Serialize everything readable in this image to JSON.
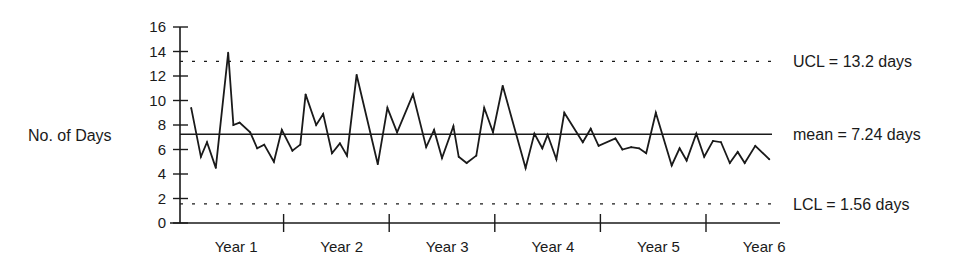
{
  "chart_data": {
    "type": "line",
    "title": "",
    "xlabel": "",
    "ylabel": "No. of Days",
    "ylim": [
      0,
      16
    ],
    "yticks": [
      0,
      2,
      4,
      6,
      8,
      10,
      12,
      14,
      16
    ],
    "xlim_months": [
      0,
      68.4
    ],
    "year_boundaries_months": [
      12,
      24,
      36,
      48,
      60
    ],
    "categories": [
      "Year 1",
      "Year 2",
      "Year 3",
      "Year 4",
      "Year 5",
      "Year 6"
    ],
    "grid": false,
    "legend": "none",
    "reference_lines": [
      {
        "name": "UCL",
        "value": 13.2,
        "style": "dotted",
        "label": "UCL = 13.2 days"
      },
      {
        "name": "mean",
        "value": 7.24,
        "style": "solid",
        "label": "mean = 7.24 days"
      },
      {
        "name": "LCL",
        "value": 1.56,
        "style": "dotted",
        "label": "LCL = 1.56 days"
      }
    ],
    "series": [
      {
        "name": "No. of Days",
        "x": [
          1.5,
          2.6,
          3.3,
          4.3,
          5.7,
          6.3,
          7.0,
          8.2,
          9.0,
          9.8,
          10.9,
          11.8,
          13.0,
          13.9,
          14.5,
          15.7,
          16.5,
          17.5,
          18.4,
          19.2,
          20.3,
          22.7,
          23.8,
          24.9,
          26.7,
          28.2,
          29.1,
          30.0,
          31.3,
          31.9,
          32.8,
          33.9,
          34.8,
          35.8,
          36.9,
          39.5,
          40.5,
          41.4,
          42.0,
          43.0,
          43.9,
          46.0,
          46.9,
          47.8,
          49.7,
          50.5,
          51.5,
          52.4,
          53.2,
          54.3,
          56.1,
          57.0,
          57.8,
          58.9,
          59.8,
          60.8,
          61.7,
          62.7,
          63.6,
          64.4,
          65.6,
          67.2
        ],
        "values": [
          9.4,
          5.4,
          6.6,
          4.5,
          13.9,
          8.0,
          8.2,
          7.4,
          6.1,
          6.4,
          5.0,
          7.6,
          5.9,
          6.4,
          10.5,
          8.0,
          8.9,
          5.7,
          6.5,
          5.5,
          12.1,
          4.8,
          9.4,
          7.4,
          10.5,
          6.2,
          7.6,
          5.3,
          7.9,
          5.4,
          4.9,
          5.5,
          9.4,
          7.4,
          11.2,
          4.5,
          7.3,
          6.1,
          7.2,
          5.2,
          9.0,
          6.6,
          7.7,
          6.3,
          6.9,
          6.0,
          6.2,
          6.1,
          5.7,
          9.0,
          4.7,
          6.1,
          5.1,
          7.3,
          5.4,
          6.7,
          6.6,
          4.9,
          5.8,
          4.9,
          6.3,
          5.2
        ]
      }
    ],
    "colors": {
      "line": "#1a1a1a",
      "background": "#ffffff"
    }
  }
}
